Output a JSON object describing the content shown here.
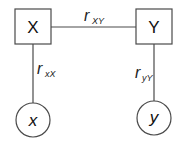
{
  "diagram": {
    "nodes": {
      "X": {
        "label": "X",
        "shape": "square"
      },
      "Y": {
        "label": "Y",
        "shape": "square"
      },
      "x": {
        "label": "x",
        "shape": "circle"
      },
      "y": {
        "label": "y",
        "shape": "circle"
      }
    },
    "edges": {
      "XY": {
        "from": "X",
        "to": "Y",
        "label_main": "r",
        "label_sub": "XY"
      },
      "xX": {
        "from": "x",
        "to": "X",
        "label_main": "r",
        "label_sub": "xX"
      },
      "yY": {
        "from": "y",
        "to": "Y",
        "label_main": "r",
        "label_sub": "yY"
      }
    },
    "colors": {
      "stroke": "#4a4a4a",
      "text": "#111111",
      "background": "#ffffff"
    }
  }
}
